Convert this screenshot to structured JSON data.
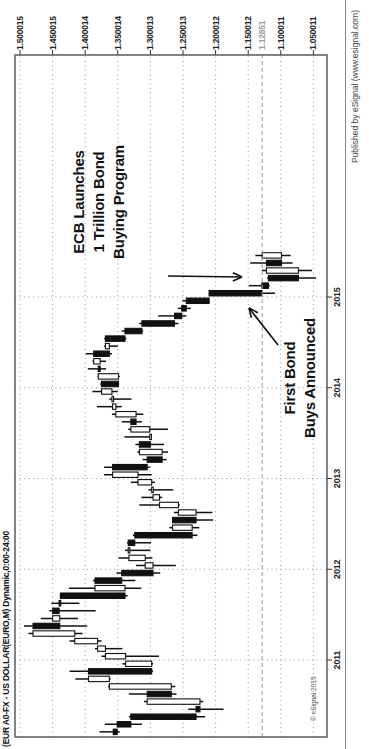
{
  "title": "(EUR A0-FX - US DOLLAR(EURO,M) Dynamic,0:00-24:00",
  "publisher": "Published by eSignal (www.esignal.com)",
  "copyright": "© eSignal 2015",
  "colors": {
    "background": "#ffffff",
    "frame": "#666666",
    "grid": "#999999",
    "candle": "#111111",
    "up_fill": "#ffffff",
    "down_fill": "#111111",
    "current_price": "#9a9a9a",
    "annotation": "#111111",
    "axis_label": "#222222"
  },
  "annotations": {
    "ecb": {
      "lines": [
        "ECB Launches",
        "1 Trillion Bond",
        "Buying Program"
      ]
    },
    "first_bond": {
      "lines": [
        "First Bond",
        "Buys Announced"
      ]
    }
  },
  "chart_data": {
    "type": "candlestick",
    "symbol": "EUR A0-FX - US DOLLAR (EURO, Monthly)",
    "title": "(EUR A0-FX - US DOLLAR(EURO,M) Dynamic,0:00-24:00",
    "legend_position": "none",
    "grid": "dotted",
    "current_price": 1.12851,
    "current_price_label": "1.12851",
    "y_axis": {
      "labels": [
        "1.500015",
        "1.450015",
        "1.400014",
        "1.350014",
        "1.300013",
        "1.250013",
        "1.200012",
        "1.150012",
        "1.100011",
        "1.050011"
      ],
      "values": [
        1.500015,
        1.450015,
        1.400014,
        1.350014,
        1.300013,
        1.250013,
        1.200012,
        1.150012,
        1.100011,
        1.050011
      ],
      "ylim": [
        1.0285,
        1.5077
      ]
    },
    "x_axis": {
      "labels": [
        "2011",
        "2012",
        "2013",
        "2014",
        "2015"
      ],
      "years": [
        2011,
        2012,
        2013,
        2014,
        2015
      ]
    },
    "series": [
      [
        "2010-03",
        1.357,
        1.378,
        1.347,
        1.351
      ],
      [
        "2010-04",
        1.351,
        1.37,
        1.313,
        1.33
      ],
      [
        "2010-05",
        1.33,
        1.333,
        1.216,
        1.23
      ],
      [
        "2010-06",
        1.23,
        1.242,
        1.188,
        1.224
      ],
      [
        "2010-07",
        1.224,
        1.31,
        1.219,
        1.305
      ],
      [
        "2010-08",
        1.305,
        1.333,
        1.26,
        1.268
      ],
      [
        "2010-09",
        1.268,
        1.365,
        1.262,
        1.363
      ],
      [
        "2010-10",
        1.363,
        1.415,
        1.361,
        1.395
      ],
      [
        "2010-11",
        1.395,
        1.424,
        1.296,
        1.298
      ],
      [
        "2010-12",
        1.298,
        1.343,
        1.296,
        1.338
      ],
      [
        "2011-01",
        1.338,
        1.375,
        1.287,
        1.369
      ],
      [
        "2011-02",
        1.369,
        1.385,
        1.343,
        1.381
      ],
      [
        "2011-03",
        1.381,
        1.424,
        1.375,
        1.416
      ],
      [
        "2011-04",
        1.416,
        1.487,
        1.404,
        1.48
      ],
      [
        "2011-05",
        1.48,
        1.494,
        1.397,
        1.439
      ],
      [
        "2011-06",
        1.439,
        1.468,
        1.411,
        1.45
      ],
      [
        "2011-07",
        1.45,
        1.455,
        1.384,
        1.44
      ],
      [
        "2011-08",
        1.44,
        1.452,
        1.409,
        1.438
      ],
      [
        "2011-09",
        1.438,
        1.439,
        1.335,
        1.339
      ],
      [
        "2011-10",
        1.339,
        1.425,
        1.314,
        1.385
      ],
      [
        "2011-11",
        1.385,
        1.388,
        1.323,
        1.344
      ],
      [
        "2011-12",
        1.344,
        1.352,
        1.285,
        1.296
      ],
      [
        "2012-01",
        1.296,
        1.322,
        1.261,
        1.308
      ],
      [
        "2012-02",
        1.308,
        1.349,
        1.297,
        1.333
      ],
      [
        "2012-03",
        1.333,
        1.339,
        1.3,
        1.334
      ],
      [
        "2012-04",
        1.334,
        1.336,
        1.299,
        1.324
      ],
      [
        "2012-05",
        1.324,
        1.327,
        1.228,
        1.236
      ],
      [
        "2012-06",
        1.236,
        1.271,
        1.225,
        1.266
      ],
      [
        "2012-07",
        1.266,
        1.267,
        1.204,
        1.23
      ],
      [
        "2012-08",
        1.23,
        1.264,
        1.205,
        1.257
      ],
      [
        "2012-09",
        1.257,
        1.317,
        1.255,
        1.286
      ],
      [
        "2012-10",
        1.286,
        1.314,
        1.282,
        1.296
      ],
      [
        "2012-11",
        1.296,
        1.303,
        1.265,
        1.298
      ],
      [
        "2012-12",
        1.298,
        1.33,
        1.293,
        1.319
      ],
      [
        "2013-01",
        1.319,
        1.371,
        1.298,
        1.358
      ],
      [
        "2013-02",
        1.358,
        1.371,
        1.301,
        1.305
      ],
      [
        "2013-03",
        1.305,
        1.312,
        1.275,
        1.282
      ],
      [
        "2013-04",
        1.282,
        1.32,
        1.273,
        1.317
      ],
      [
        "2013-05",
        1.317,
        1.323,
        1.279,
        1.3
      ],
      [
        "2013-06",
        1.3,
        1.34,
        1.298,
        1.301
      ],
      [
        "2013-07",
        1.301,
        1.334,
        1.273,
        1.33
      ],
      [
        "2013-08",
        1.33,
        1.344,
        1.313,
        1.322
      ],
      [
        "2013-09",
        1.322,
        1.359,
        1.311,
        1.353
      ],
      [
        "2013-10",
        1.353,
        1.382,
        1.344,
        1.358
      ],
      [
        "2013-11",
        1.358,
        1.363,
        1.329,
        1.359
      ],
      [
        "2013-12",
        1.359,
        1.389,
        1.35,
        1.375
      ],
      [
        "2014-01",
        1.375,
        1.377,
        1.348,
        1.349
      ],
      [
        "2014-02",
        1.349,
        1.381,
        1.347,
        1.38
      ],
      [
        "2014-03",
        1.38,
        1.396,
        1.368,
        1.377
      ],
      [
        "2014-04",
        1.377,
        1.389,
        1.368,
        1.387
      ],
      [
        "2014-05",
        1.387,
        1.399,
        1.359,
        1.363
      ],
      [
        "2014-06",
        1.363,
        1.371,
        1.35,
        1.369
      ],
      [
        "2014-07",
        1.369,
        1.371,
        1.337,
        1.339
      ],
      [
        "2014-08",
        1.339,
        1.344,
        1.311,
        1.313
      ],
      [
        "2014-09",
        1.313,
        1.317,
        1.257,
        1.263
      ],
      [
        "2014-10",
        1.263,
        1.288,
        1.245,
        1.252
      ],
      [
        "2014-11",
        1.252,
        1.258,
        1.238,
        1.245
      ],
      [
        "2014-12",
        1.245,
        1.251,
        1.209,
        1.21
      ],
      [
        "2015-01",
        1.21,
        1.21,
        1.109,
        1.129
      ],
      [
        "2015-02",
        1.129,
        1.149,
        1.117,
        1.119
      ],
      [
        "2015-03",
        1.119,
        1.121,
        1.046,
        1.073
      ],
      [
        "2015-04",
        1.073,
        1.129,
        1.052,
        1.122
      ],
      [
        "2015-05",
        1.122,
        1.147,
        1.082,
        1.099
      ],
      [
        "2015-06",
        1.099,
        1.139,
        1.085,
        1.1285
      ]
    ]
  }
}
